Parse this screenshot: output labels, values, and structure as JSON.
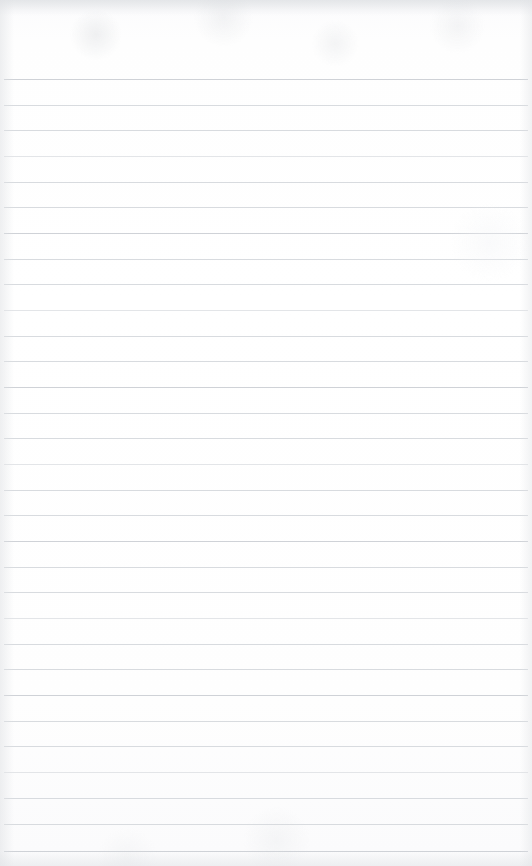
{
  "document": {
    "type": "ruled-notepaper-scan",
    "title": "Blank lined paper",
    "width": 532,
    "height": 866,
    "page_background_color": "#fefefe",
    "rule_color": "#d6d9dd",
    "rule_color_faint": "#e0e2e6",
    "rule_color_strong": "#cfd2d7",
    "rule_thickness_px": 1,
    "rule_spacing_px": 25.7,
    "first_rule_y_px": 79,
    "last_rule_y_px": 851,
    "rule_left_x_px": 4,
    "rule_right_x_px": 528,
    "top_margin_px": 79,
    "bottom_margin_px": 15,
    "text_content": "",
    "has_vertical_margin_rule": false,
    "has_holes": false,
    "has_header": false,
    "line_count": 31
  },
  "rules": [
    {
      "y": 79,
      "tone": "strong"
    },
    {
      "y": 105,
      "tone": "normal"
    },
    {
      "y": 130,
      "tone": "normal"
    },
    {
      "y": 156,
      "tone": "faint"
    },
    {
      "y": 182,
      "tone": "normal"
    },
    {
      "y": 207,
      "tone": "normal"
    },
    {
      "y": 233,
      "tone": "strong"
    },
    {
      "y": 259,
      "tone": "normal"
    },
    {
      "y": 284,
      "tone": "normal"
    },
    {
      "y": 310,
      "tone": "faint"
    },
    {
      "y": 336,
      "tone": "normal"
    },
    {
      "y": 361,
      "tone": "normal"
    },
    {
      "y": 387,
      "tone": "strong"
    },
    {
      "y": 413,
      "tone": "normal"
    },
    {
      "y": 438,
      "tone": "normal"
    },
    {
      "y": 464,
      "tone": "faint"
    },
    {
      "y": 490,
      "tone": "normal"
    },
    {
      "y": 515,
      "tone": "normal"
    },
    {
      "y": 541,
      "tone": "strong"
    },
    {
      "y": 567,
      "tone": "normal"
    },
    {
      "y": 592,
      "tone": "normal"
    },
    {
      "y": 618,
      "tone": "faint"
    },
    {
      "y": 644,
      "tone": "normal"
    },
    {
      "y": 669,
      "tone": "normal"
    },
    {
      "y": 695,
      "tone": "strong"
    },
    {
      "y": 721,
      "tone": "normal"
    },
    {
      "y": 746,
      "tone": "normal"
    },
    {
      "y": 772,
      "tone": "faint"
    },
    {
      "y": 798,
      "tone": "normal"
    },
    {
      "y": 824,
      "tone": "normal"
    },
    {
      "y": 851,
      "tone": "strong"
    }
  ]
}
